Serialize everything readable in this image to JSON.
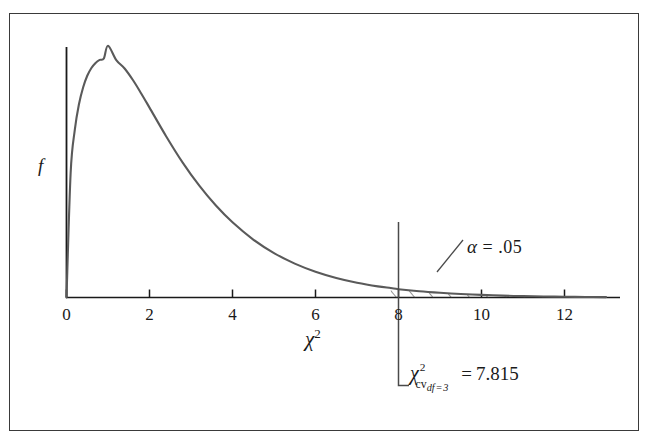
{
  "figure": {
    "border_color": "#3a3a3a",
    "background": "#ffffff",
    "curve_color": "#5a5a5a",
    "axis_color": "#1a1a1a"
  },
  "axes": {
    "y_label": "f",
    "x_label_base": "χ",
    "x_label_exponent": "2",
    "x_ticks": [
      {
        "value": 0,
        "label": "0"
      },
      {
        "value": 2,
        "label": "2"
      },
      {
        "value": 4,
        "label": "4"
      },
      {
        "value": 6,
        "label": "6"
      },
      {
        "value": 8,
        "label": "8"
      },
      {
        "value": 10,
        "label": "10"
      },
      {
        "value": 12,
        "label": "12"
      }
    ]
  },
  "annotations": {
    "alpha": {
      "symbol": "α",
      "equals": "=",
      "value": ".05",
      "full_text": "α = .05"
    },
    "critical_value": {
      "base": "χ",
      "exponent": "2",
      "subscript_cv": "cv",
      "subscript_df": "df = 3",
      "equals": "=",
      "value": "7.815",
      "full_text": "χ²cv df=3 = 7.815"
    }
  },
  "chart_data": {
    "type": "line",
    "title": "",
    "subtitle": "",
    "xlabel": "χ²",
    "ylabel": "f",
    "xlim": [
      0,
      13.3
    ],
    "ylim": [
      0,
      0.26
    ],
    "grid": false,
    "legend": null,
    "distribution": "chi-square",
    "degrees_of_freedom": 3,
    "peak": {
      "x": 1.0,
      "y": 0.242
    },
    "critical_value": 7.815,
    "tail_area_alpha": 0.05,
    "shaded_region": {
      "style": "diagonal-hatch",
      "from_x": 7.815,
      "to_x": 13.0,
      "label": "α = .05"
    },
    "x": [
      0,
      0.1,
      0.2,
      0.3,
      0.4,
      0.5,
      0.6,
      0.7,
      0.8,
      0.9,
      1.0,
      1.2,
      1.4,
      1.6,
      1.8,
      2.0,
      2.4,
      2.8,
      3.2,
      3.6,
      4.0,
      4.5,
      5.0,
      5.5,
      6.0,
      6.5,
      7.0,
      7.5,
      7.815,
      8.0,
      8.5,
      9.0,
      9.5,
      10.0,
      10.5,
      11.0,
      11.5,
      12.0,
      12.5,
      13.0
    ],
    "y": [
      0.0,
      0.12,
      0.1612,
      0.1858,
      0.202,
      0.2132,
      0.2207,
      0.2256,
      0.2285,
      0.2298,
      0.242,
      0.2283,
      0.2202,
      0.2091,
      0.1962,
      0.1826,
      0.1551,
      0.1297,
      0.1075,
      0.0884,
      0.0723,
      0.0557,
      0.0427,
      0.0326,
      0.0248,
      0.0188,
      0.0142,
      0.0107,
      0.0091,
      0.008,
      0.006,
      0.0045,
      0.0033,
      0.0025,
      0.0018,
      0.0013,
      0.001,
      0.0007,
      0.0005,
      0.0004
    ],
    "x_ticks": [
      0,
      2,
      4,
      6,
      8,
      10,
      12
    ],
    "x_tick_labels": [
      "0",
      "2",
      "4",
      "6",
      "8",
      "10",
      "12"
    ],
    "y_ticks": [],
    "y_tick_labels": []
  }
}
